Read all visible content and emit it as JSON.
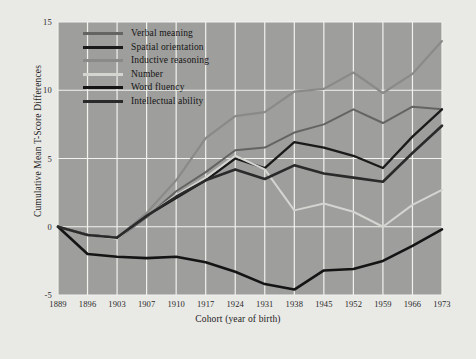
{
  "chart_data": {
    "type": "line",
    "title": "",
    "xlabel": "Cohort (year of birth)",
    "ylabel": "Cumulative Mean T-Score Differences",
    "categories": [
      1889,
      1896,
      1903,
      1907,
      1910,
      1917,
      1924,
      1931,
      1938,
      1945,
      1952,
      1959,
      1966,
      1973
    ],
    "xtick_labels": [
      "1889",
      "1896",
      "1903",
      "1907",
      "1910",
      "1917",
      "1924",
      "1931",
      "1938",
      "1945",
      "1952",
      "1959",
      "1966",
      "1973"
    ],
    "ytick_labels": [
      "15",
      "10",
      "5",
      "0",
      "-5"
    ],
    "ytick_values": [
      15,
      10,
      5,
      0,
      -5
    ],
    "ylim": [
      -5,
      15
    ],
    "grid": "both",
    "legend_position": "top-left",
    "series": [
      {
        "name": "Verbal meaning",
        "color": "#646462",
        "width": 2.0,
        "values": [
          0.0,
          -0.6,
          -0.9,
          0.7,
          2.6,
          4.0,
          5.6,
          5.8,
          6.9,
          7.5,
          8.6,
          7.6,
          8.8,
          8.6
        ]
      },
      {
        "name": "Spatial orientation",
        "color": "#1a1a1a",
        "width": 2.3,
        "values": [
          0.0,
          -0.6,
          -0.8,
          0.8,
          2.1,
          3.4,
          5.0,
          4.3,
          6.2,
          5.8,
          5.2,
          4.3,
          6.6,
          8.6
        ]
      },
      {
        "name": "Inductive reasoning",
        "color": "#8a8a88",
        "width": 2.2,
        "values": [
          0.0,
          -0.6,
          -0.8,
          1.0,
          3.4,
          6.5,
          8.1,
          8.4,
          9.9,
          10.1,
          11.3,
          9.8,
          11.2,
          13.6
        ]
      },
      {
        "name": "Number",
        "color": "#d4d4d1",
        "width": 2.0,
        "values": [
          0.0,
          -0.6,
          -0.9,
          0.8,
          2.3,
          3.6,
          5.2,
          4.2,
          1.2,
          1.7,
          1.1,
          0.0,
          1.6,
          2.7
        ]
      },
      {
        "name": "Word fluency",
        "color": "#141414",
        "width": 2.6,
        "values": [
          0.0,
          -2.0,
          -2.2,
          -2.3,
          -2.2,
          -2.6,
          -3.3,
          -4.2,
          -4.6,
          -3.2,
          -3.1,
          -2.5,
          -1.4,
          -0.2
        ]
      },
      {
        "name": "Intellectual ability",
        "color": "#2a2a2a",
        "width": 2.6,
        "values": [
          0.0,
          -0.6,
          -0.8,
          0.8,
          2.2,
          3.4,
          4.2,
          3.5,
          4.5,
          3.9,
          3.6,
          3.3,
          5.4,
          7.4
        ]
      }
    ]
  },
  "legend": {
    "entries": [
      {
        "label": "Verbal meaning",
        "color": "#646462"
      },
      {
        "label": "Spatial orientation",
        "color": "#1a1a1a"
      },
      {
        "label": "Inductive reasoning",
        "color": "#8a8a88"
      },
      {
        "label": "Number",
        "color": "#d4d4d1"
      },
      {
        "label": "Word fluency",
        "color": "#141414"
      },
      {
        "label": "Intellectual ability",
        "color": "#2a2a2a"
      }
    ]
  },
  "colors": {
    "page_background": "#e9e9e6",
    "plot_background": "#9e9e9c",
    "gridline": "#f2f2ef",
    "text": "#1d1d1d"
  }
}
